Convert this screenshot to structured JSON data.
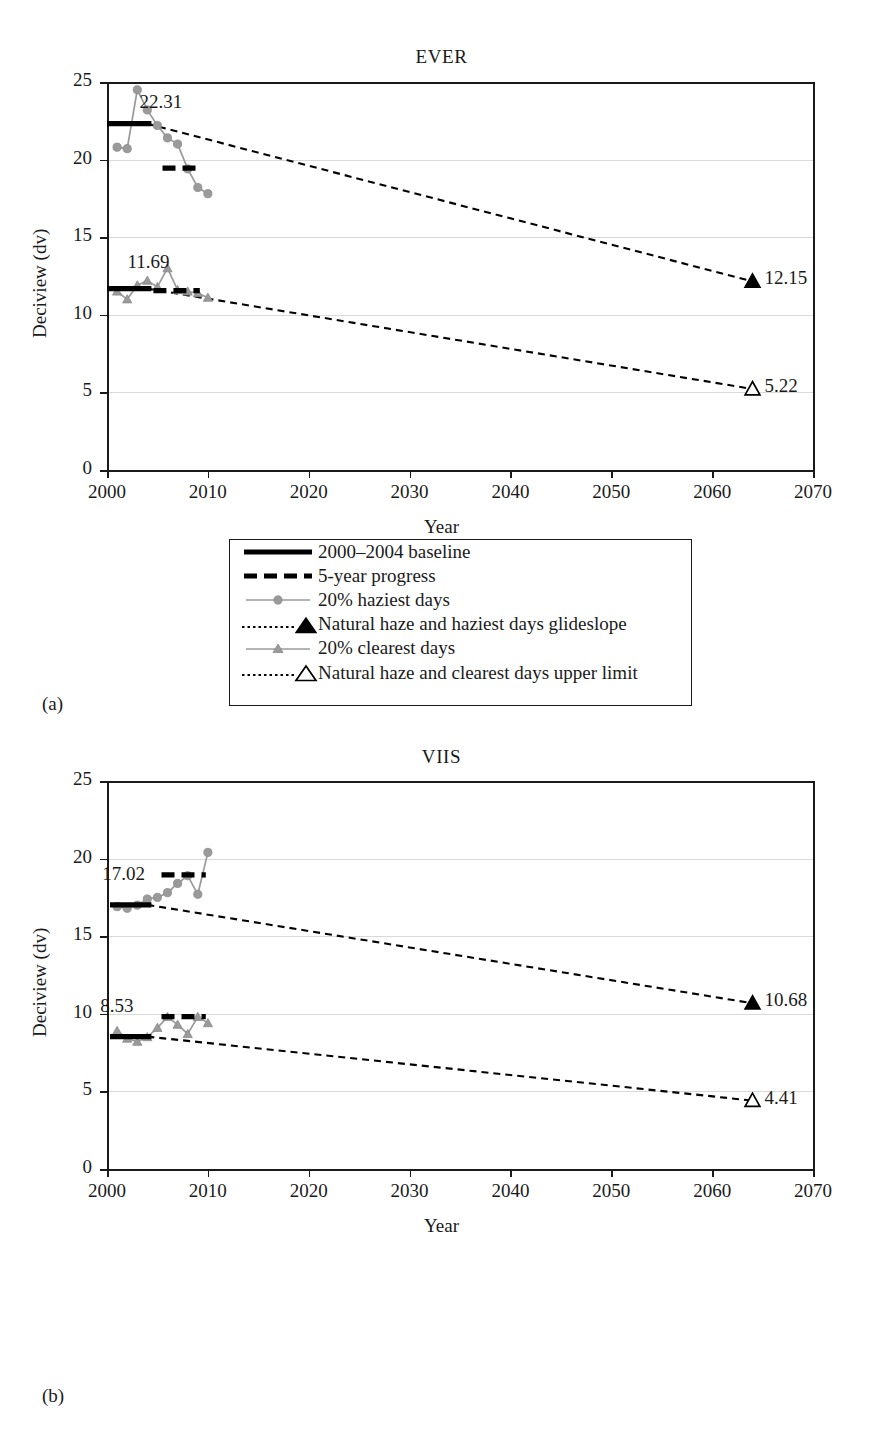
{
  "figure": {
    "panels": [
      {
        "label": "(a)",
        "title": "EVER"
      },
      {
        "label": "(b)",
        "title": "VIIS"
      }
    ],
    "axis": {
      "xlabel": "Year",
      "ylabel": "Deciview (dv)",
      "xticks": [
        "2000",
        "2010",
        "2020",
        "2030",
        "2040",
        "2050",
        "2060",
        "2070"
      ],
      "yticks": [
        "0",
        "5",
        "10",
        "15",
        "20",
        "25"
      ],
      "xlim": [
        2000,
        2070
      ],
      "ylim": [
        0,
        25
      ]
    },
    "legend": {
      "items": [
        {
          "key": "solid-black-line",
          "label": "2000–2004 baseline"
        },
        {
          "key": "dashed-black-line",
          "label": "5-year progress"
        },
        {
          "key": "gray-line-circle",
          "label": "20% haziest days"
        },
        {
          "key": "dotted-line-filled-triangle",
          "label": "Natural haze and haziest days glideslope"
        },
        {
          "key": "gray-line-triangle",
          "label": "20% clearest days"
        },
        {
          "key": "dotted-line-open-triangle",
          "label": "Natural haze and clearest days upper limit"
        }
      ]
    },
    "colors": {
      "series_gray": "#9a9a9a",
      "baseline_black": "#000000",
      "grid": "#d9d9d9",
      "axis": "#1a1a1a"
    }
  },
  "chart_data": [
    {
      "type": "line",
      "title": "EVER",
      "panel": "(a)",
      "xlabel": "Year",
      "ylabel": "Deciview (dv)",
      "xlim": [
        2000,
        2070
      ],
      "ylim": [
        0,
        25
      ],
      "xticks": [
        2000,
        2010,
        2020,
        2030,
        2040,
        2050,
        2060,
        2070
      ],
      "yticks": [
        0,
        5,
        10,
        15,
        20,
        25
      ],
      "grid": "horizontal",
      "legend_position": "below-plot",
      "annotations": [
        {
          "text": "22.31",
          "x": 2006.2,
          "y": 23.6,
          "refers_to": "haziest baseline"
        },
        {
          "text": "11.69",
          "x": 2005.0,
          "y": 13.3,
          "refers_to": "clearest baseline"
        },
        {
          "text": "12.15",
          "x": 2065.0,
          "y": 12.15,
          "refers_to": "haziest glideslope endpoint"
        },
        {
          "text": "5.22",
          "x": 2065.0,
          "y": 5.22,
          "refers_to": "clearest upper limit endpoint"
        }
      ],
      "series": [
        {
          "name": "20% haziest days",
          "style": "gray-line-circle",
          "x": [
            2001,
            2002,
            2003,
            2004,
            2005,
            2006,
            2007,
            2008,
            2009,
            2010
          ],
          "values": [
            20.8,
            20.7,
            24.5,
            23.2,
            22.2,
            21.4,
            21.0,
            19.4,
            18.2,
            17.8
          ]
        },
        {
          "name": "20% clearest days",
          "style": "gray-line-triangle",
          "x": [
            2001,
            2002,
            2003,
            2004,
            2005,
            2006,
            2007,
            2008,
            2009,
            2010
          ],
          "values": [
            11.5,
            11.0,
            11.9,
            12.2,
            11.8,
            13.0,
            11.6,
            11.5,
            11.4,
            11.1
          ]
        },
        {
          "name": "2000–2004 baseline (haziest)",
          "style": "solid-black-line",
          "x": [
            2000,
            2004.4
          ],
          "values": [
            22.31,
            22.31
          ]
        },
        {
          "name": "2000–2004 baseline (clearest)",
          "style": "solid-black-line",
          "x": [
            2000,
            2004.4
          ],
          "values": [
            11.69,
            11.69
          ]
        },
        {
          "name": "5-year progress (haziest)",
          "style": "dashed-black-line",
          "x": [
            2005.5,
            2009.2
          ],
          "values": [
            19.45,
            19.45
          ]
        },
        {
          "name": "5-year progress (clearest)",
          "style": "dashed-black-line",
          "x": [
            2004.6,
            2009.2
          ],
          "values": [
            11.55,
            11.55
          ]
        },
        {
          "name": "Natural haze and haziest days glideslope",
          "style": "dotted-line-filled-triangle",
          "x": [
            2004,
            2064
          ],
          "values": [
            22.31,
            12.15
          ]
        },
        {
          "name": "Natural haze and clearest days upper limit",
          "style": "dotted-line-open-triangle",
          "x": [
            2004,
            2064
          ],
          "values": [
            11.69,
            5.22
          ]
        }
      ]
    },
    {
      "type": "line",
      "title": "VIIS",
      "panel": "(b)",
      "xlabel": "Year",
      "ylabel": "Deciview (dv)",
      "xlim": [
        2000,
        2070
      ],
      "ylim": [
        0,
        25
      ],
      "xticks": [
        2000,
        2010,
        2020,
        2030,
        2040,
        2050,
        2060,
        2070
      ],
      "yticks": [
        0,
        5,
        10,
        15,
        20,
        25
      ],
      "grid": "horizontal",
      "legend_position": "below-plot",
      "annotations": [
        {
          "text": "17.02",
          "x": 2002.5,
          "y": 18.9,
          "refers_to": "haziest baseline"
        },
        {
          "text": "8.53",
          "x": 2002.3,
          "y": 10.4,
          "refers_to": "clearest baseline"
        },
        {
          "text": "10.68",
          "x": 2065.0,
          "y": 10.68,
          "refers_to": "haziest glideslope endpoint"
        },
        {
          "text": "4.41",
          "x": 2065.0,
          "y": 4.41,
          "refers_to": "clearest upper limit endpoint"
        }
      ],
      "series": [
        {
          "name": "20% haziest days",
          "style": "gray-line-circle",
          "x": [
            2001,
            2002,
            2003,
            2004,
            2005,
            2006,
            2007,
            2008,
            2009,
            2010
          ],
          "values": [
            16.9,
            16.8,
            17.0,
            17.4,
            17.5,
            17.8,
            18.4,
            18.9,
            17.7,
            20.4
          ]
        },
        {
          "name": "20% clearest days",
          "style": "gray-line-triangle",
          "x": [
            2001,
            2002,
            2003,
            2004,
            2005,
            2006,
            2007,
            2008,
            2009,
            2010
          ],
          "values": [
            8.9,
            8.4,
            8.2,
            8.5,
            9.1,
            9.8,
            9.3,
            8.7,
            9.8,
            9.4
          ]
        },
        {
          "name": "2000–2004 baseline (haziest)",
          "style": "solid-black-line",
          "x": [
            2000.3,
            2004.4
          ],
          "values": [
            17.02,
            17.02
          ]
        },
        {
          "name": "2000–2004 baseline (clearest)",
          "style": "solid-black-line",
          "x": [
            2000.3,
            2004.4
          ],
          "values": [
            8.53,
            8.53
          ]
        },
        {
          "name": "5-year progress (haziest)",
          "style": "dashed-black-line",
          "x": [
            2005.4,
            2009.8
          ],
          "values": [
            18.95,
            18.95
          ]
        },
        {
          "name": "5-year progress (clearest)",
          "style": "dashed-black-line",
          "x": [
            2005.4,
            2009.8
          ],
          "values": [
            9.82,
            9.82
          ]
        },
        {
          "name": "Natural haze and haziest days glideslope",
          "style": "dotted-line-filled-triangle",
          "x": [
            2004,
            2064
          ],
          "values": [
            17.02,
            10.68
          ]
        },
        {
          "name": "Natural haze and clearest days upper limit",
          "style": "dotted-line-open-triangle",
          "x": [
            2004,
            2064
          ],
          "values": [
            8.53,
            4.41
          ]
        }
      ]
    }
  ]
}
